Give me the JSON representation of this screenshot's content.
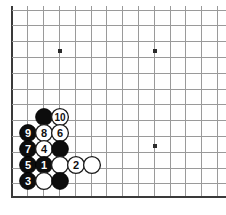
{
  "figure": {
    "kind": "go-board-diagram",
    "title": "",
    "board_region": "bottom-left corner",
    "background_color": "#ffffff",
    "grid_color": "#9a9a9a",
    "edge_color": "#3a3a3a",
    "black_color": "#0d0d0d",
    "white_color": "#ffffff"
  },
  "grid": {
    "origin_x": 12,
    "origin_y": 10,
    "spacing": 15.8,
    "cols": 14,
    "rows": 12,
    "left_edge_x": 12,
    "bottom_edge_y": 197,
    "stone_radius": 8.4
  },
  "star_points": [
    {
      "name": "star-point-upper-left",
      "x": 60,
      "y": 51
    },
    {
      "name": "star-point-upper-right",
      "x": 155,
      "y": 51
    },
    {
      "name": "star-point-lower-right",
      "x": 155,
      "y": 146
    }
  ],
  "stones": [
    {
      "id": "stone-black-upper",
      "color": "black",
      "label": "",
      "x": 44,
      "y": 117
    },
    {
      "id": "stone-white-10",
      "color": "white",
      "label": "10",
      "x": 60,
      "y": 117
    },
    {
      "id": "stone-black-9",
      "color": "black",
      "label": "9",
      "x": 28,
      "y": 133
    },
    {
      "id": "stone-white-8",
      "color": "white",
      "label": "8",
      "x": 44,
      "y": 133
    },
    {
      "id": "stone-white-6",
      "color": "white",
      "label": "6",
      "x": 60,
      "y": 133
    },
    {
      "id": "stone-black-7",
      "color": "black",
      "label": "7",
      "x": 28,
      "y": 149
    },
    {
      "id": "stone-white-4",
      "color": "white",
      "label": "4",
      "x": 44,
      "y": 149
    },
    {
      "id": "stone-black-mid-right",
      "color": "black",
      "label": "",
      "x": 60,
      "y": 149
    },
    {
      "id": "stone-black-5",
      "color": "black",
      "label": "5",
      "x": 28,
      "y": 165
    },
    {
      "id": "stone-black-1",
      "color": "black",
      "label": "1",
      "x": 44,
      "y": 165
    },
    {
      "id": "stone-white-plain-a",
      "color": "white",
      "label": "",
      "x": 60,
      "y": 165
    },
    {
      "id": "stone-white-2",
      "color": "white",
      "label": "2",
      "x": 76,
      "y": 165
    },
    {
      "id": "stone-white-plain-b",
      "color": "white",
      "label": "",
      "x": 92,
      "y": 165
    },
    {
      "id": "stone-black-3",
      "color": "black",
      "label": "3",
      "x": 28,
      "y": 181
    },
    {
      "id": "stone-white-plain-c",
      "color": "white",
      "label": "",
      "x": 44,
      "y": 181
    },
    {
      "id": "stone-black-lower-right",
      "color": "black",
      "label": "",
      "x": 60,
      "y": 181
    }
  ],
  "move_sequence": {
    "black_moves": [
      "1",
      "3",
      "5",
      "7",
      "9"
    ],
    "white_moves": [
      "2",
      "4",
      "6",
      "8",
      "10"
    ],
    "total_numbered_moves": 10
  }
}
